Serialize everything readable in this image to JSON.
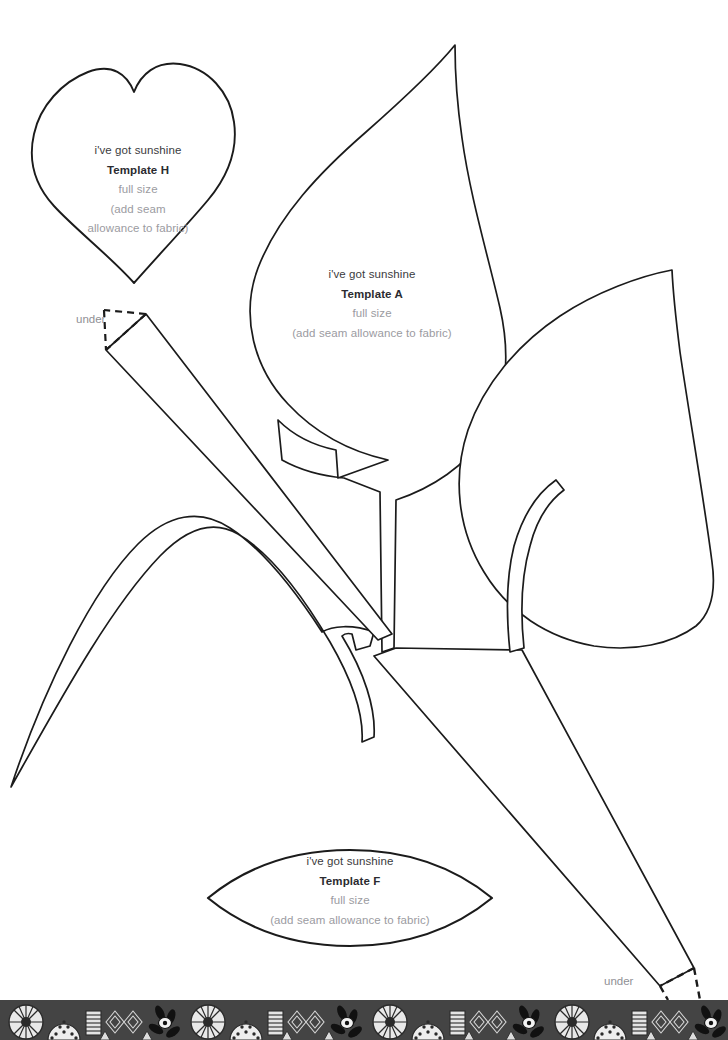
{
  "page": {
    "background": "#ffffff",
    "ink": "#1b1b1b",
    "text_dark": "#3b3b40",
    "text_bold": "#2b2b30",
    "text_light": "#9b9ba1",
    "width": 728,
    "height": 1040
  },
  "templates": [
    {
      "id": "H",
      "shape": "heart",
      "brand": "i've got sunshine",
      "name": "Template H",
      "size": "full size",
      "note_line1": "(add seam",
      "note_line2": "allowance to fabric)",
      "note_wrapped": true
    },
    {
      "id": "A",
      "shape": "pointed-leaf",
      "brand": "i've got sunshine",
      "name": "Template A",
      "size": "full size",
      "note_line1": "(add seam allowance to fabric)",
      "note_wrapped": false
    },
    {
      "id": "F",
      "shape": "lens-leaf",
      "brand": "i've got sunshine",
      "name": "Template F",
      "size": "full size",
      "note_line1": "(add seam allowance to fabric)",
      "note_wrapped": false
    }
  ],
  "markers": [
    {
      "label": "under",
      "position": "upper-left-stem"
    },
    {
      "label": "under",
      "position": "lower-right-stem"
    }
  ],
  "decorative_strip": {
    "present": true,
    "description": "black and white patterned fabric border"
  }
}
